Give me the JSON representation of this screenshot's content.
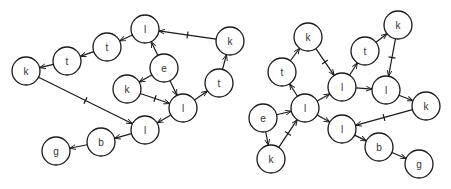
{
  "style": {
    "stroke": "#1a1a1a",
    "fill": "#ffffff",
    "label_color": "#333333",
    "node_radius": 14
  },
  "graphs": [
    {
      "name": "left-graph",
      "nodes": [
        {
          "id": "L1",
          "label": "l",
          "x": 145,
          "y": 29
        },
        {
          "id": "L2",
          "label": "t",
          "x": 107,
          "y": 47
        },
        {
          "id": "L3",
          "label": "t",
          "x": 67,
          "y": 61
        },
        {
          "id": "L4",
          "label": "k",
          "x": 26,
          "y": 71
        },
        {
          "id": "L5",
          "label": "e",
          "x": 164,
          "y": 68
        },
        {
          "id": "L6",
          "label": "k",
          "x": 127,
          "y": 89
        },
        {
          "id": "L7",
          "label": "l",
          "x": 183,
          "y": 108
        },
        {
          "id": "L8",
          "label": "l",
          "x": 145,
          "y": 130
        },
        {
          "id": "L9",
          "label": "b",
          "x": 101,
          "y": 142
        },
        {
          "id": "L10",
          "label": "g",
          "x": 56,
          "y": 151
        },
        {
          "id": "L11",
          "label": "k",
          "x": 230,
          "y": 41
        },
        {
          "id": "L12",
          "label": "t",
          "x": 219,
          "y": 83
        }
      ],
      "edges": [
        {
          "from": "L11",
          "to": "L1",
          "tick": true
        },
        {
          "from": "L1",
          "to": "L2",
          "tick": false
        },
        {
          "from": "L2",
          "to": "L3",
          "tick": false
        },
        {
          "from": "L3",
          "to": "L4",
          "tick": false
        },
        {
          "from": "L5",
          "to": "L1",
          "tick": false
        },
        {
          "from": "L5",
          "to": "L6",
          "tick": false
        },
        {
          "from": "L6",
          "to": "L7",
          "tick": true
        },
        {
          "from": "L5",
          "to": "L7",
          "tick": false
        },
        {
          "from": "L7",
          "to": "L12",
          "tick": false
        },
        {
          "from": "L12",
          "to": "L11",
          "tick": false
        },
        {
          "from": "L7",
          "to": "L8",
          "tick": false
        },
        {
          "from": "L4",
          "to": "L8",
          "tick": true
        },
        {
          "from": "L8",
          "to": "L9",
          "tick": false
        },
        {
          "from": "L9",
          "to": "L10",
          "tick": false
        }
      ]
    },
    {
      "name": "right-graph",
      "nodes": [
        {
          "id": "R1",
          "label": "k",
          "x": 308,
          "y": 37
        },
        {
          "id": "R2",
          "label": "t",
          "x": 282,
          "y": 72
        },
        {
          "id": "R3",
          "label": "l",
          "x": 305,
          "y": 108
        },
        {
          "id": "R4",
          "label": "e",
          "x": 263,
          "y": 118
        },
        {
          "id": "R5",
          "label": "k",
          "x": 271,
          "y": 159
        },
        {
          "id": "R6",
          "label": "l",
          "x": 342,
          "y": 87
        },
        {
          "id": "R7",
          "label": "t",
          "x": 365,
          "y": 51
        },
        {
          "id": "R8",
          "label": "k",
          "x": 398,
          "y": 25
        },
        {
          "id": "R9",
          "label": "l",
          "x": 386,
          "y": 90
        },
        {
          "id": "R10",
          "label": "k",
          "x": 426,
          "y": 106
        },
        {
          "id": "R11",
          "label": "l",
          "x": 342,
          "y": 129
        },
        {
          "id": "R12",
          "label": "b",
          "x": 379,
          "y": 147
        },
        {
          "id": "R13",
          "label": "g",
          "x": 419,
          "y": 164
        }
      ],
      "edges": [
        {
          "from": "R4",
          "to": "R3",
          "tick": false
        },
        {
          "from": "R4",
          "to": "R5",
          "tick": false
        },
        {
          "from": "R5",
          "to": "R3",
          "tick": true
        },
        {
          "from": "R3",
          "to": "R2",
          "tick": false
        },
        {
          "from": "R2",
          "to": "R1",
          "tick": false
        },
        {
          "from": "R1",
          "to": "R6",
          "tick": true
        },
        {
          "from": "R3",
          "to": "R6",
          "tick": false
        },
        {
          "from": "R3",
          "to": "R11",
          "tick": false
        },
        {
          "from": "R6",
          "to": "R7",
          "tick": false
        },
        {
          "from": "R7",
          "to": "R8",
          "tick": false
        },
        {
          "from": "R8",
          "to": "R9",
          "tick": true
        },
        {
          "from": "R6",
          "to": "R9",
          "tick": false
        },
        {
          "from": "R9",
          "to": "R10",
          "tick": false
        },
        {
          "from": "R10",
          "to": "R11",
          "tick": true
        },
        {
          "from": "R11",
          "to": "R12",
          "tick": false
        },
        {
          "from": "R12",
          "to": "R13",
          "tick": false
        }
      ]
    }
  ]
}
